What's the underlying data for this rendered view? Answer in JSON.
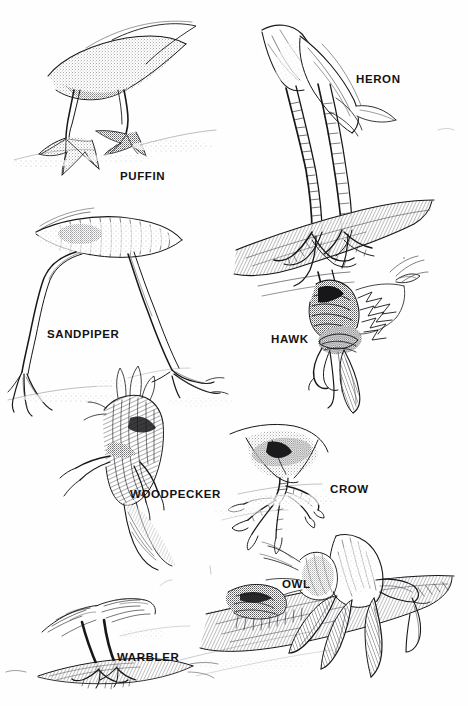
{
  "plate": {
    "title": "Bird Feet Types Illustration Plate",
    "background_color": "#fefefe",
    "ink_color": "#17171a",
    "medium": "pen-and-ink stipple drawing",
    "label_count": 8
  },
  "specimens": [
    {
      "id": "puffin",
      "label": "PUFFIN",
      "foot_type": "palmate-webbed",
      "position": {
        "x": 120,
        "y": 170
      }
    },
    {
      "id": "heron",
      "label": "HERON",
      "foot_type": "semipalmate-long-toed",
      "position": {
        "x": 356,
        "y": 73
      }
    },
    {
      "id": "sandpiper",
      "label": "SANDPIPER",
      "foot_type": "incumbent-wading",
      "position": {
        "x": 48,
        "y": 328
      }
    },
    {
      "id": "hawk",
      "label": "HAWK",
      "foot_type": "raptorial-talon",
      "position": {
        "x": 272,
        "y": 333
      }
    },
    {
      "id": "woodpecker",
      "label": "WOODPECKER",
      "foot_type": "zygodactyl-clinging",
      "position": {
        "x": 131,
        "y": 488
      }
    },
    {
      "id": "crow",
      "label": "CROW",
      "foot_type": "anisodactyl-perching",
      "position": {
        "x": 330,
        "y": 483
      }
    },
    {
      "id": "owl",
      "label": "OWL",
      "foot_type": "raptorial-feathered",
      "position": {
        "x": 283,
        "y": 578
      }
    },
    {
      "id": "warbler",
      "label": "WARBLER",
      "foot_type": "passerine-perching",
      "position": {
        "x": 118,
        "y": 651
      }
    }
  ]
}
